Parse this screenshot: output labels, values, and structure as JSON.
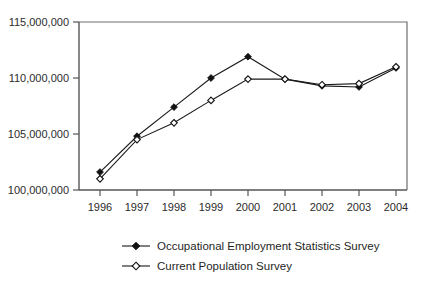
{
  "chart_data": {
    "type": "line",
    "title": "",
    "xlabel": "",
    "ylabel": "",
    "categories": [
      "1996",
      "1997",
      "1998",
      "1999",
      "2000",
      "2001",
      "2002",
      "2003",
      "2004"
    ],
    "x": [
      1996,
      1997,
      1998,
      1999,
      2000,
      2001,
      2002,
      2003,
      2004
    ],
    "series": [
      {
        "name": "Occupational Employment Statistics Survey",
        "marker": "filled-diamond",
        "values": [
          101600000,
          104800000,
          107400000,
          110000000,
          111900000,
          109900000,
          109300000,
          109200000,
          110900000
        ]
      },
      {
        "name": "Current Population Survey",
        "marker": "open-diamond",
        "values": [
          101000000,
          104500000,
          106000000,
          108000000,
          109900000,
          109900000,
          109400000,
          109500000,
          111000000
        ]
      }
    ],
    "ylim": [
      100000000,
      115000000
    ],
    "yticks": [
      100000000,
      105000000,
      110000000,
      115000000
    ],
    "ytick_labels": [
      "100,000,000",
      "105,000,000",
      "110,000,000",
      "115,000,000"
    ],
    "xtick_labels": [
      "1996",
      "1997",
      "1998",
      "1999",
      "2000",
      "2001",
      "2002",
      "2003",
      "2004"
    ],
    "grid": false,
    "legend_position": "bottom",
    "legend_entries": [
      "Occupational Employment Statistics Survey",
      "Current Population Survey"
    ],
    "colors": {
      "line": "#1a1a1a",
      "axis": "#555555",
      "frame": "#6e6e6e",
      "background": "#ffffff"
    }
  }
}
